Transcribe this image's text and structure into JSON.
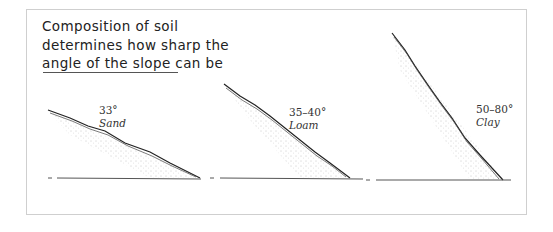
{
  "title": "Composition of soil determines how sharp the angle of the slope can be",
  "slopes": [
    {
      "angle": "33°",
      "soil": "Sand"
    },
    {
      "angle": "35–40°",
      "soil": "Loam"
    },
    {
      "angle": "50–80°",
      "soil": "Clay"
    }
  ],
  "colors": {
    "ink": "#222222",
    "frame": "#cfcfcf",
    "ground": "#555555"
  }
}
